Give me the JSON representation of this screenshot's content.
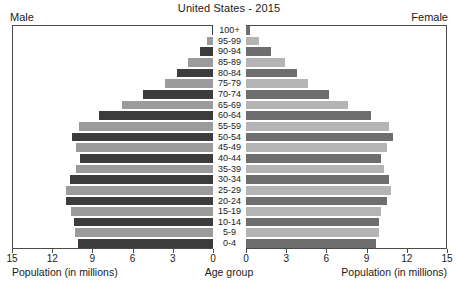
{
  "chart_data": {
    "type": "bar",
    "subtype": "population-pyramid",
    "title": "United States - 2015",
    "left_header": "Male",
    "right_header": "Female",
    "xlabel_left": "Population (in millions)",
    "xlabel_center": "Age group",
    "xlabel_right": "Population (in millions)",
    "ylabel": "Age group",
    "grid": false,
    "legend": "none",
    "xlim_left": [
      15,
      0
    ],
    "xlim_right": [
      0,
      15
    ],
    "ticks_left": [
      "15",
      "12",
      "9",
      "6",
      "3",
      "0"
    ],
    "ticks_right": [
      "0",
      "3",
      "6",
      "9",
      "12",
      "15"
    ],
    "tick_values": [
      0,
      3,
      6,
      9,
      12,
      15
    ],
    "categories": [
      "100+",
      "95-99",
      "90-94",
      "85-89",
      "80-84",
      "75-79",
      "70-74",
      "65-69",
      "60-64",
      "55-59",
      "50-54",
      "45-49",
      "40-44",
      "35-39",
      "30-34",
      "25-29",
      "20-24",
      "15-19",
      "10-14",
      "5-9",
      "0-4"
    ],
    "series": [
      {
        "name": "Male",
        "side": "left",
        "values": [
          0.08,
          0.45,
          1.0,
          1.9,
          2.7,
          3.6,
          5.2,
          6.8,
          8.5,
          10.0,
          10.5,
          10.2,
          9.9,
          10.2,
          10.7,
          11.0,
          11.0,
          10.6,
          10.4,
          10.3,
          10.1
        ]
      },
      {
        "name": "Female",
        "side": "right",
        "values": [
          0.3,
          1.0,
          1.9,
          2.9,
          3.8,
          4.6,
          6.2,
          7.6,
          9.3,
          10.7,
          11.0,
          10.5,
          10.1,
          10.3,
          10.7,
          10.8,
          10.5,
          10.1,
          9.9,
          9.9,
          9.7
        ]
      }
    ],
    "colors": {
      "male_dark": "#3c3c3c",
      "male_light": "#9b9b9b",
      "female_dark": "#6e6e6e",
      "female_light": "#b4b4b4",
      "frame": "#4a4a4a",
      "background": "#ffffff",
      "text": "#1a1a1a"
    }
  }
}
